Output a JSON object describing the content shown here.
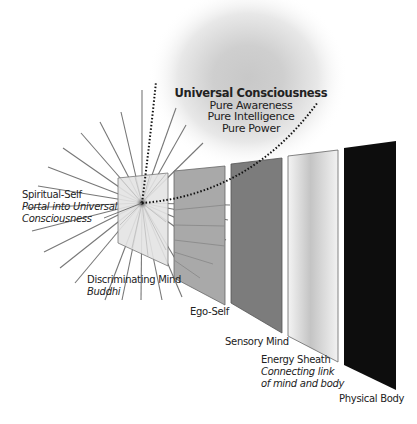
{
  "diagram": {
    "title": "Universal Consciousness",
    "attributes": [
      "Pure Awareness",
      "Pure Intelligence",
      "Pure Power"
    ],
    "layers": [
      {
        "name": "Spiritual-Self",
        "subtitle": "Portal into Universal",
        "subtitle2": "Consciousness",
        "fill": "#e6e6e6"
      },
      {
        "name": "Discriminating Mind",
        "subtitle": "Buddhi",
        "fill": "#b5b5b5"
      },
      {
        "name": "Ego-Self",
        "fill": "#a8a8a8"
      },
      {
        "name": "Sensory Mind",
        "fill": "#7d7d7d"
      },
      {
        "name": "Energy Sheath",
        "subtitle": "Connecting link",
        "subtitle2": "of mind and body",
        "fill": "#d0d0d0"
      },
      {
        "name": "Physical Body",
        "fill": "#0d0d0d"
      }
    ]
  }
}
